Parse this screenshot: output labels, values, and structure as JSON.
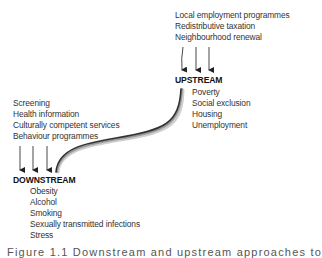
{
  "upstream": {
    "interventions": [
      "Local employment programmes",
      "Redistributive taxation",
      "Neighbourhood renewal"
    ],
    "heading": "UPSTREAM",
    "factors": [
      "Poverty",
      "Social exclusion",
      "Housing",
      "Unemployment"
    ]
  },
  "downstream": {
    "interventions": [
      "Screening",
      "Health information",
      "Culturally competent services",
      "Behaviour programmes"
    ],
    "heading": "DOWNSTREAM",
    "factors": [
      "Obesity",
      "Alcohol",
      "Smoking",
      "Sexually transmitted infections",
      "Stress"
    ]
  },
  "caption": "Figure 1.1  Downstream and upstream approaches to"
}
